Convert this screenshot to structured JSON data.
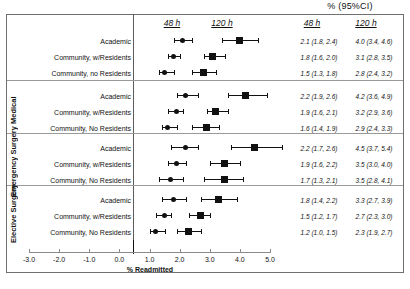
{
  "figure": {
    "top_title": "% (95%CI)",
    "axis_title": "% Readmitted"
  },
  "headers": {
    "plot_48": "48 h",
    "plot_120": "120 h",
    "value_48": "48 h",
    "value_120": "120 h"
  },
  "axis": {
    "ticks": [
      "-3.0",
      "-2.0",
      "-1.0",
      "0.0",
      "1.0",
      "2.0",
      "3.0",
      "4.0",
      "5.0"
    ]
  },
  "groups": [
    {
      "name": "",
      "rows": [
        {
          "label": "Academic",
          "v48": {
            "est": 2.1,
            "lo": 1.8,
            "hi": 2.4,
            "text": "2.1 (1.8, 2.4)"
          },
          "v120": {
            "est": 4.0,
            "lo": 3.4,
            "hi": 4.6,
            "text": "4.0 (3.4, 4.6)"
          }
        },
        {
          "label": "Community, w/Residents",
          "v48": {
            "est": 1.8,
            "lo": 1.6,
            "hi": 2.0,
            "text": "1.8 (1.6, 2.0)"
          },
          "v120": {
            "est": 3.1,
            "lo": 2.8,
            "hi": 3.5,
            "text": "3.1 (2.8, 3.5)"
          }
        },
        {
          "label": "Community, no Residents",
          "v48": {
            "est": 1.5,
            "lo": 1.3,
            "hi": 1.8,
            "text": "1.5 (1.3, 1.8)"
          },
          "v120": {
            "est": 2.8,
            "lo": 2.4,
            "hi": 3.2,
            "text": "2.8 (2.4, 3.2)"
          }
        }
      ]
    },
    {
      "name": "Medical",
      "rows": [
        {
          "label": "Academic",
          "v48": {
            "est": 2.2,
            "lo": 1.9,
            "hi": 2.6,
            "text": "2.2 (1.9, 2.6)"
          },
          "v120": {
            "est": 4.2,
            "lo": 3.6,
            "hi": 4.9,
            "text": "4.2 (3.6, 4.9)"
          }
        },
        {
          "label": "Community, w/Residents",
          "v48": {
            "est": 1.9,
            "lo": 1.6,
            "hi": 2.1,
            "text": "1.9 (1.6, 2.1)"
          },
          "v120": {
            "est": 3.2,
            "lo": 2.9,
            "hi": 3.6,
            "text": "3.2 (2.9, 3.6)"
          }
        },
        {
          "label": "Community, No Residents",
          "v48": {
            "est": 1.6,
            "lo": 1.4,
            "hi": 1.9,
            "text": "1.6 (1.4, 1.9)"
          },
          "v120": {
            "est": 2.9,
            "lo": 2.4,
            "hi": 3.3,
            "text": "2.9 (2.4, 3.3)"
          }
        }
      ]
    },
    {
      "name": "Emergency Surgery",
      "rows": [
        {
          "label": "Academic",
          "v48": {
            "est": 2.2,
            "lo": 1.7,
            "hi": 2.6,
            "text": "2.2 (1.7, 2.6)"
          },
          "v120": {
            "est": 4.5,
            "lo": 3.7,
            "hi": 5.4,
            "text": "4.5 (3.7, 5.4)"
          }
        },
        {
          "label": "Community, w/Residents",
          "v48": {
            "est": 1.9,
            "lo": 1.6,
            "hi": 2.2,
            "text": "1.9 (1.6, 2.2)"
          },
          "v120": {
            "est": 3.5,
            "lo": 3.0,
            "hi": 4.0,
            "text": "3.5 (3.0, 4.0)"
          }
        },
        {
          "label": "Community, No Residents",
          "v48": {
            "est": 1.7,
            "lo": 1.3,
            "hi": 2.1,
            "text": "1.7 (1.3, 2.1)"
          },
          "v120": {
            "est": 3.5,
            "lo": 2.8,
            "hi": 4.1,
            "text": "3.5 (2.8, 4.1)"
          }
        }
      ]
    },
    {
      "name": "Elective Surgery",
      "rows": [
        {
          "label": "Academic",
          "v48": {
            "est": 1.8,
            "lo": 1.4,
            "hi": 2.2,
            "text": "1.8 (1.4, 2.2)"
          },
          "v120": {
            "est": 3.3,
            "lo": 2.7,
            "hi": 3.9,
            "text": "3.3 (2.7, 3.9)"
          }
        },
        {
          "label": "Community, w/Residents",
          "v48": {
            "est": 1.5,
            "lo": 1.2,
            "hi": 1.7,
            "text": "1.5 (1.2, 1.7)"
          },
          "v120": {
            "est": 2.7,
            "lo": 2.3,
            "hi": 3.0,
            "text": "2.7 (2.3, 3.0)"
          }
        },
        {
          "label": "Community, No Residents",
          "v48": {
            "est": 1.2,
            "lo": 1.0,
            "hi": 1.5,
            "text": "1.2 (1.0, 1.5)"
          },
          "v120": {
            "est": 2.3,
            "lo": 1.9,
            "hi": 2.7,
            "text": "2.3 (1.9, 2.7)"
          }
        }
      ]
    }
  ],
  "chart_data": {
    "type": "scatter",
    "title": "% (95%CI)",
    "xlabel": "% Readmitted",
    "ylabel": "",
    "xlim": [
      -3.0,
      5.0
    ],
    "xticks": [
      -3.0,
      -2.0,
      -1.0,
      0.0,
      1.0,
      2.0,
      3.0,
      4.0,
      5.0
    ],
    "grid": false,
    "legend": [
      "48 h",
      "120 h"
    ],
    "legend_position": "top",
    "panels": [
      {
        "group": "",
        "categories": [
          "Academic",
          "Community, w/Residents",
          "Community, no Residents"
        ],
        "series": [
          {
            "name": "48 h",
            "values": [
              2.1,
              1.8,
              1.5
            ],
            "ci_low": [
              1.8,
              1.6,
              1.3
            ],
            "ci_high": [
              2.4,
              2.0,
              1.8
            ]
          },
          {
            "name": "120 h",
            "values": [
              4.0,
              3.1,
              2.8
            ],
            "ci_low": [
              3.4,
              2.8,
              2.4
            ],
            "ci_high": [
              4.6,
              3.5,
              3.2
            ]
          }
        ]
      },
      {
        "group": "Medical",
        "categories": [
          "Academic",
          "Community, w/Residents",
          "Community, No Residents"
        ],
        "series": [
          {
            "name": "48 h",
            "values": [
              2.2,
              1.9,
              1.6
            ],
            "ci_low": [
              1.9,
              1.6,
              1.4
            ],
            "ci_high": [
              2.6,
              2.1,
              1.9
            ]
          },
          {
            "name": "120 h",
            "values": [
              4.2,
              3.2,
              2.9
            ],
            "ci_low": [
              3.6,
              2.9,
              2.4
            ],
            "ci_high": [
              4.9,
              3.6,
              3.3
            ]
          }
        ]
      },
      {
        "group": "Emergency Surgery",
        "categories": [
          "Academic",
          "Community, w/Residents",
          "Community, No Residents"
        ],
        "series": [
          {
            "name": "48 h",
            "values": [
              2.2,
              1.9,
              1.7
            ],
            "ci_low": [
              1.7,
              1.6,
              1.3
            ],
            "ci_high": [
              2.6,
              2.2,
              2.1
            ]
          },
          {
            "name": "120 h",
            "values": [
              4.5,
              3.5,
              3.5
            ],
            "ci_low": [
              3.7,
              3.0,
              2.8
            ],
            "ci_high": [
              5.4,
              4.0,
              4.1
            ]
          }
        ]
      },
      {
        "group": "Elective Surgery",
        "categories": [
          "Academic",
          "Community, w/Residents",
          "Community, No Residents"
        ],
        "series": [
          {
            "name": "48 h",
            "values": [
              1.8,
              1.5,
              1.2
            ],
            "ci_low": [
              1.4,
              1.2,
              1.0
            ],
            "ci_high": [
              2.2,
              1.7,
              1.5
            ]
          },
          {
            "name": "120 h",
            "values": [
              3.3,
              2.7,
              2.3
            ],
            "ci_low": [
              2.7,
              2.3,
              1.9
            ],
            "ci_high": [
              3.9,
              3.0,
              2.7
            ]
          }
        ]
      }
    ]
  }
}
